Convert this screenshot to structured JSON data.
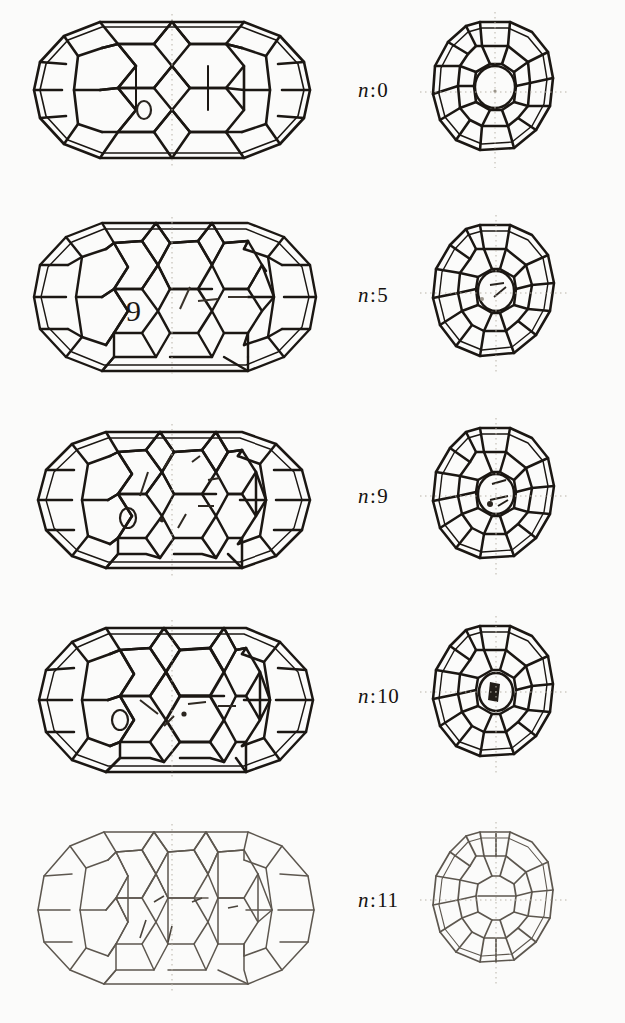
{
  "figure": {
    "background_color": "#fbfbfa",
    "ink_color": "#1b1713",
    "faint_ink_color": "#5d574f",
    "guide_color": "#b9b3a8",
    "columns": [
      {
        "key": "side",
        "caption": "side view (long axis horizontal)"
      },
      {
        "key": "axial",
        "caption": "end-on view along the tube axis"
      }
    ],
    "rows": [
      {
        "id": "row-n0",
        "label_var": "n",
        "label_sep": ":",
        "label_value": "0",
        "label_text": "n:0",
        "n": 0,
        "side": {
          "name": "side-view-n0",
          "shape": "capsule",
          "rings_around": 10,
          "belt_rows": 3,
          "width": 295,
          "height": 160,
          "line_weight": "heavy",
          "marker": "O"
        },
        "axial": {
          "name": "axial-view-n0",
          "shape": "polyhedral-disc",
          "outer_vertices": 14,
          "mid_ring": 10,
          "inner_ring": 10,
          "width": 130,
          "height": 150,
          "line_weight": "heavy"
        }
      },
      {
        "id": "row-n5",
        "label_var": "n",
        "label_sep": ":",
        "label_value": "5",
        "label_text": "n:5",
        "n": 5,
        "side": {
          "name": "side-view-n5",
          "shape": "capsule",
          "rings_around": 12,
          "belt_rows": 4,
          "width": 300,
          "height": 165,
          "line_weight": "heavy",
          "marker": "9"
        },
        "axial": {
          "name": "axial-view-n5",
          "shape": "polyhedral-disc",
          "outer_vertices": 14,
          "mid_ring": 12,
          "inner_ring": 10,
          "width": 130,
          "height": 152,
          "line_weight": "heavy"
        }
      },
      {
        "id": "row-n9",
        "label_var": "n",
        "label_sep": ":",
        "label_value": "9",
        "label_text": "n:9",
        "n": 9,
        "side": {
          "name": "side-view-n9",
          "shape": "capsule",
          "rings_around": 11,
          "belt_rows": 4,
          "width": 295,
          "height": 162,
          "line_weight": "heavy",
          "marker": "O"
        },
        "axial": {
          "name": "axial-view-n9",
          "shape": "polyhedral-disc",
          "outer_vertices": 14,
          "mid_ring": 12,
          "inner_ring": 10,
          "width": 128,
          "height": 152,
          "line_weight": "heavy"
        }
      },
      {
        "id": "row-n10",
        "label_var": "n",
        "label_sep": ":",
        "label_value": "10",
        "label_text": "n:10",
        "n": 10,
        "side": {
          "name": "side-view-n10",
          "shape": "capsule",
          "rings_around": 10,
          "belt_rows": 4,
          "width": 300,
          "height": 160,
          "line_weight": "heavy",
          "marker": "O"
        },
        "axial": {
          "name": "axial-view-n10",
          "shape": "polyhedral-disc",
          "outer_vertices": 14,
          "mid_ring": 12,
          "inner_ring": 10,
          "width": 128,
          "height": 150,
          "line_weight": "heavy"
        }
      },
      {
        "id": "row-n11",
        "label_var": "n",
        "label_sep": ":",
        "label_value": "11",
        "label_text": "n:11",
        "n": 11,
        "side": {
          "name": "side-view-n11",
          "shape": "capsule",
          "rings_around": 12,
          "belt_rows": 5,
          "width": 300,
          "height": 160,
          "line_weight": "light",
          "marker": ""
        },
        "axial": {
          "name": "axial-view-n11",
          "shape": "polyhedral-disc",
          "outer_vertices": 14,
          "mid_ring": 12,
          "inner_ring": 10,
          "width": 126,
          "height": 150,
          "line_weight": "light"
        }
      }
    ]
  }
}
